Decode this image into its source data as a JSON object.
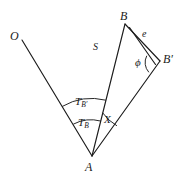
{
  "figure": {
    "caption_fragment": "",
    "background_color": "#ffffff",
    "ink_color": "#1b1b1b",
    "width": 185,
    "height": 181
  },
  "labels": {
    "origin": "O",
    "apex": "A",
    "point_b": "B",
    "point_b_prime_base": "B",
    "point_b_prime_mark": "′",
    "side_s": "S",
    "side_e": "e",
    "angle_phi": "ϕ",
    "angle_x": "X",
    "angle_tb_base": "T",
    "angle_tb_sub": "B",
    "angle_tbp_base": "T",
    "angle_tbp_sub": "B′"
  },
  "geometry": {
    "points": {
      "O": {
        "x": 22,
        "y": 40
      },
      "A": {
        "x": 92,
        "y": 156
      },
      "B": {
        "x": 125,
        "y": 24
      },
      "B_prime": {
        "x": 160,
        "y": 61
      },
      "B_inner": {
        "x": 129,
        "y": 27
      },
      "B_prime_inner": {
        "x": 156,
        "y": 64
      }
    },
    "segments": [
      {
        "name": "ray-O-A",
        "from": "O",
        "to": "A"
      },
      {
        "name": "ray-A-B",
        "from": "A",
        "to": "B"
      },
      {
        "name": "ray-A-Bprime",
        "from": "A",
        "to": "B_prime"
      },
      {
        "name": "edge-B-Bprime-outer",
        "from": "B",
        "to": "B_prime"
      },
      {
        "name": "edge-B-Bprime-inner",
        "from": "B_inner",
        "to": "B_prime_inner"
      }
    ],
    "arcs": [
      {
        "name": "arc-T-b-prime",
        "radius": 58,
        "center": "A"
      },
      {
        "name": "arc-T-b",
        "radius": 37,
        "center": "A"
      },
      {
        "name": "arc-X",
        "radius": 44,
        "center": "A"
      },
      {
        "name": "arc-phi",
        "radius": 14,
        "center": "B_prime"
      }
    ]
  }
}
